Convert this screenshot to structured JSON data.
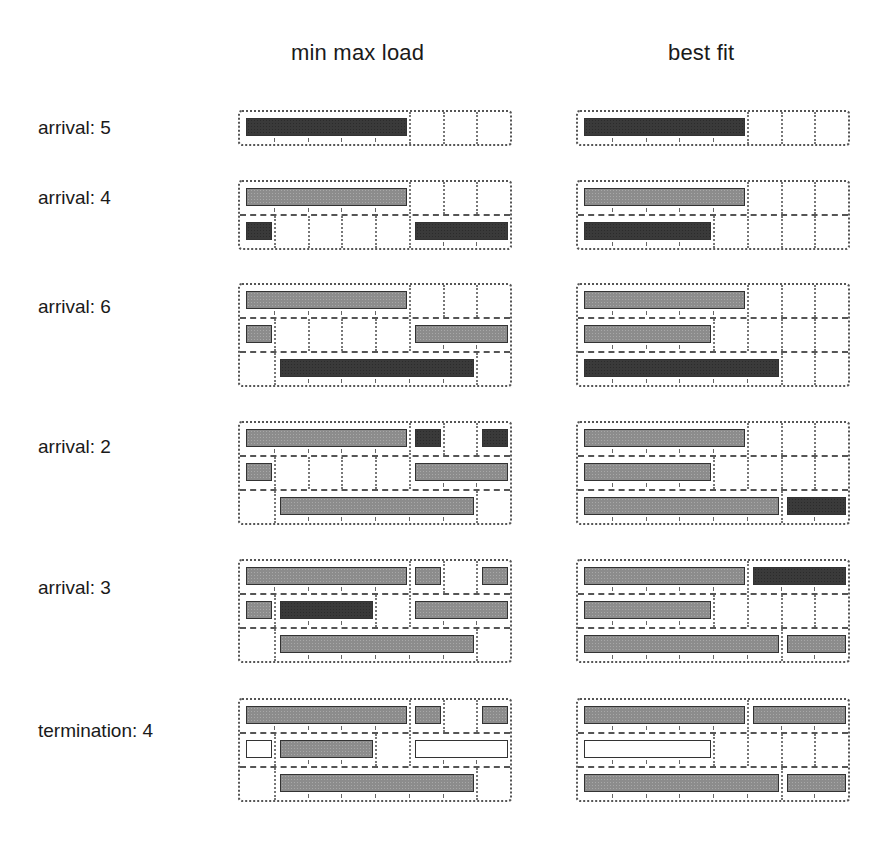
{
  "columns": [
    {
      "title": "min max load"
    },
    {
      "title": "best fit"
    }
  ],
  "steps": [
    {
      "label": "arrival: 5"
    },
    {
      "label": "arrival: 4"
    },
    {
      "label": "arrival: 6"
    },
    {
      "label": "arrival: 2"
    },
    {
      "label": "arrival: 3"
    },
    {
      "label": "termination: 4"
    }
  ],
  "grid": {
    "units_per_row": 8,
    "colors": {
      "dark": "#3a3a3a",
      "gray": "#8c8c8c",
      "white": "#ffffff",
      "border": "#555555"
    }
  },
  "schedules": {
    "min_max_load": [
      [
        [
          {
            "start": 0,
            "len": 5,
            "shade": "dark"
          }
        ]
      ],
      [
        [
          {
            "start": 0,
            "len": 5,
            "shade": "gray"
          }
        ],
        [
          {
            "start": 0,
            "len": 1,
            "shade": "dark"
          },
          {
            "start": 5,
            "len": 3,
            "shade": "dark"
          }
        ]
      ],
      [
        [
          {
            "start": 0,
            "len": 5,
            "shade": "gray"
          }
        ],
        [
          {
            "start": 0,
            "len": 1,
            "shade": "gray"
          },
          {
            "start": 5,
            "len": 3,
            "shade": "gray"
          }
        ],
        [
          {
            "start": 1,
            "len": 6,
            "shade": "dark"
          }
        ]
      ],
      [
        [
          {
            "start": 0,
            "len": 5,
            "shade": "gray"
          },
          {
            "start": 5,
            "len": 1,
            "shade": "dark"
          },
          {
            "start": 7,
            "len": 1,
            "shade": "dark"
          }
        ],
        [
          {
            "start": 0,
            "len": 1,
            "shade": "gray"
          },
          {
            "start": 5,
            "len": 3,
            "shade": "gray"
          }
        ],
        [
          {
            "start": 1,
            "len": 6,
            "shade": "gray"
          }
        ]
      ],
      [
        [
          {
            "start": 0,
            "len": 5,
            "shade": "gray"
          },
          {
            "start": 5,
            "len": 1,
            "shade": "gray"
          },
          {
            "start": 7,
            "len": 1,
            "shade": "gray"
          }
        ],
        [
          {
            "start": 0,
            "len": 1,
            "shade": "gray"
          },
          {
            "start": 1,
            "len": 3,
            "shade": "dark"
          },
          {
            "start": 5,
            "len": 3,
            "shade": "gray"
          }
        ],
        [
          {
            "start": 1,
            "len": 6,
            "shade": "gray"
          }
        ]
      ],
      [
        [
          {
            "start": 0,
            "len": 5,
            "shade": "gray"
          },
          {
            "start": 5,
            "len": 1,
            "shade": "gray"
          },
          {
            "start": 7,
            "len": 1,
            "shade": "gray"
          }
        ],
        [
          {
            "start": 0,
            "len": 1,
            "shade": "white"
          },
          {
            "start": 1,
            "len": 3,
            "shade": "gray"
          },
          {
            "start": 5,
            "len": 3,
            "shade": "white"
          }
        ],
        [
          {
            "start": 1,
            "len": 6,
            "shade": "gray"
          }
        ]
      ]
    ],
    "best_fit": [
      [
        [
          {
            "start": 0,
            "len": 5,
            "shade": "dark"
          }
        ]
      ],
      [
        [
          {
            "start": 0,
            "len": 5,
            "shade": "gray"
          }
        ],
        [
          {
            "start": 0,
            "len": 4,
            "shade": "dark"
          }
        ]
      ],
      [
        [
          {
            "start": 0,
            "len": 5,
            "shade": "gray"
          }
        ],
        [
          {
            "start": 0,
            "len": 4,
            "shade": "gray"
          }
        ],
        [
          {
            "start": 0,
            "len": 6,
            "shade": "dark"
          }
        ]
      ],
      [
        [
          {
            "start": 0,
            "len": 5,
            "shade": "gray"
          }
        ],
        [
          {
            "start": 0,
            "len": 4,
            "shade": "gray"
          }
        ],
        [
          {
            "start": 0,
            "len": 6,
            "shade": "gray"
          },
          {
            "start": 6,
            "len": 2,
            "shade": "dark"
          }
        ]
      ],
      [
        [
          {
            "start": 0,
            "len": 5,
            "shade": "gray"
          },
          {
            "start": 5,
            "len": 3,
            "shade": "dark"
          }
        ],
        [
          {
            "start": 0,
            "len": 4,
            "shade": "gray"
          }
        ],
        [
          {
            "start": 0,
            "len": 6,
            "shade": "gray"
          },
          {
            "start": 6,
            "len": 2,
            "shade": "gray"
          }
        ]
      ],
      [
        [
          {
            "start": 0,
            "len": 5,
            "shade": "gray"
          },
          {
            "start": 5,
            "len": 3,
            "shade": "gray"
          }
        ],
        [
          {
            "start": 0,
            "len": 4,
            "shade": "white"
          }
        ],
        [
          {
            "start": 0,
            "len": 6,
            "shade": "gray"
          },
          {
            "start": 6,
            "len": 2,
            "shade": "gray"
          }
        ]
      ]
    ]
  }
}
